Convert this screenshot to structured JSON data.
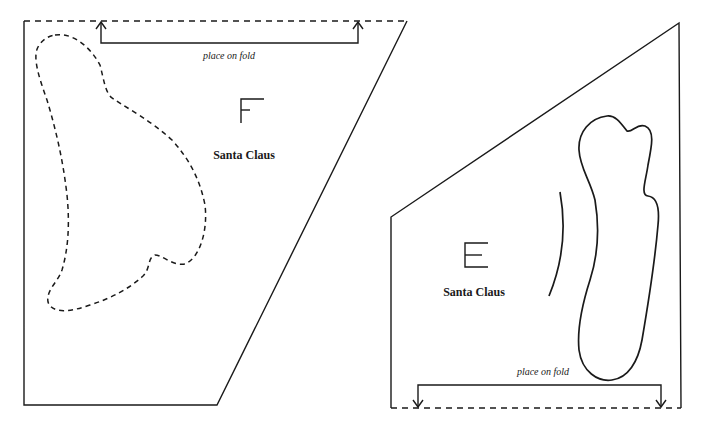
{
  "pieces": [
    {
      "id": "F",
      "letter": "F",
      "name": "Santa Claus",
      "fold_label": "place on fold",
      "fold_edge": "top"
    },
    {
      "id": "E",
      "letter": "E",
      "name": "Santa Claus",
      "fold_label": "place on fold",
      "fold_edge": "bottom"
    }
  ],
  "colors": {
    "ink": "#1a1a1a",
    "paper": "#ffffff"
  }
}
